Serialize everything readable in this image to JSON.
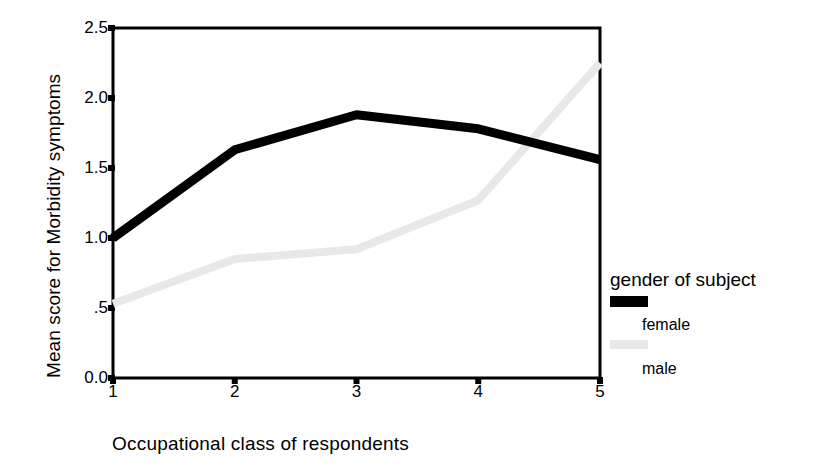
{
  "chart_data": {
    "type": "line",
    "title": "",
    "xlabel": "Occupational class of respondents",
    "ylabel": "Mean score for Morbidity symptoms",
    "categories": [
      "1",
      "2",
      "3",
      "4",
      "5"
    ],
    "x": [
      1,
      2,
      3,
      4,
      5
    ],
    "xlim": [
      1,
      5
    ],
    "ylim": [
      0.0,
      2.5
    ],
    "ytick_labels": [
      "0.0",
      ".5",
      "1.0",
      "1.5",
      "2.0",
      "2.5"
    ],
    "ytick_values": [
      0.0,
      0.5,
      1.0,
      1.5,
      2.0,
      2.5
    ],
    "xtick_labels": [
      "1",
      "2",
      "3",
      "4",
      "5"
    ],
    "grid": false,
    "legend_position": "right",
    "legend_title": "gender of subject",
    "series": [
      {
        "name": "female",
        "color": "#000000",
        "values": [
          1.0,
          1.63,
          1.88,
          1.78,
          1.56
        ]
      },
      {
        "name": "male",
        "color": "#e8e8e8",
        "values": [
          0.53,
          0.85,
          0.92,
          1.27,
          2.25
        ]
      }
    ]
  },
  "axes": {
    "y_title": "Mean score for Morbidity symptoms",
    "x_title": "Occupational class of respondents"
  },
  "legend": {
    "title": "gender of subject",
    "entries": [
      {
        "label": "female",
        "color": "#000000"
      },
      {
        "label": "male",
        "color": "#e8e8e8"
      }
    ]
  },
  "colors": {
    "female_series": "#000000",
    "male_series": "#e8e8e8",
    "axis": "#000000",
    "background": "#ffffff"
  }
}
